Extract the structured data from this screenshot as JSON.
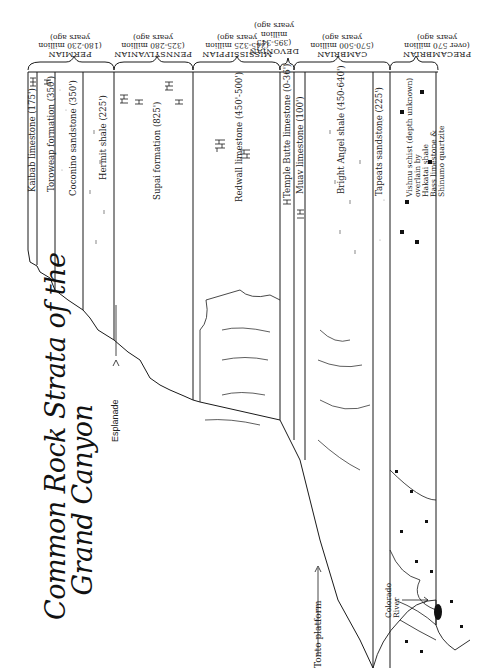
{
  "title": {
    "line1": "Common Rock Strata of the",
    "line2": "Grand Canyon"
  },
  "orientation": "rotated 90° (read with page turned clockwise)",
  "eras": [
    {
      "name": "PERMIAN",
      "age": "(180-230 million",
      "age2": "years ago)"
    },
    {
      "name": "PENNSYLVANIAN",
      "age": "(325-280 million",
      "age2": "years ago)"
    },
    {
      "name": "MISSISSIPPIAN",
      "age": "(345-325 million",
      "age2": "years ago)"
    },
    {
      "name": "DEVONIAN",
      "age": "(395-345",
      "age2": "million",
      "age3": "years ago)"
    },
    {
      "name": "CAMBRIAN",
      "age": "(570-500 million",
      "age2": "years ago)"
    },
    {
      "name": "PRECAMBRIAN",
      "age": "(over 570 million",
      "age2": "years ago)"
    }
  ],
  "layers": [
    {
      "name": "Kaibab limestone (175')",
      "era": "PERMIAN",
      "pattern": "limestone"
    },
    {
      "name": "Toroweap formation (350')",
      "era": "PERMIAN",
      "pattern": "limestone"
    },
    {
      "name": "Coconino sandstone (350')",
      "era": "PERMIAN",
      "pattern": "sandstone"
    },
    {
      "name": "Hermit shale (225')",
      "era": "PERMIAN",
      "pattern": "shale"
    },
    {
      "name": "Supai formation (825')",
      "era": "PENNSYLVANIAN",
      "pattern": "mixed"
    },
    {
      "name": "Redwall limestone (450'-500')",
      "era": "MISSISSIPPIAN",
      "pattern": "limestone"
    },
    {
      "name": "Temple Butte limestone (0-36')",
      "era": "DEVONIAN",
      "pattern": "limestone"
    },
    {
      "name": "Muav limestone (100')",
      "era": "CAMBRIAN",
      "pattern": "limestone"
    },
    {
      "name": "Bright Angel shale (450-640')",
      "era": "CAMBRIAN",
      "pattern": "shale"
    },
    {
      "name": "Tapeats sandstone (225')",
      "era": "CAMBRIAN",
      "pattern": "sandstone"
    },
    {
      "name": "Vishnu schist (depth unknown) overlain by Hakatai shale Bass limestone & Shinumo quartzite",
      "era": "PRECAMBRIAN",
      "pattern": "schist",
      "lines": [
        "Vishnu schist (depth unknown)",
        "overlain by",
        "Hakatai shale",
        "Bass limestone &",
        "Shinumo quartzite"
      ]
    }
  ],
  "annotations": {
    "esplanade": "Esplanade",
    "tonto": "Tonto platform",
    "river_line1": "Colorado",
    "river_line2": "River"
  },
  "colors": {
    "ink": "#1a1a1a",
    "paper": "#ffffff",
    "stipple": "#bbbbbb"
  }
}
